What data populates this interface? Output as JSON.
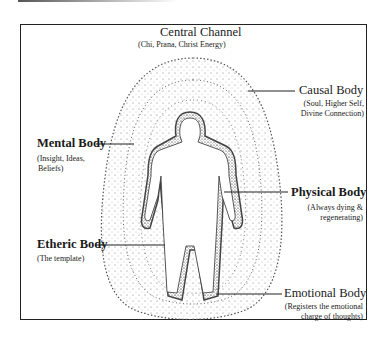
{
  "diagram": {
    "labels": {
      "central_channel": {
        "title": "Central Channel",
        "subtitle": "(Chi, Prana, Christ Energy)"
      },
      "causal_body": {
        "title": "Causal Body",
        "subtitle_line1": "(Soul, Higher Self,",
        "subtitle_line2": "Divine Connection)"
      },
      "mental_body": {
        "title": "Mental Body",
        "subtitle_line1": "(Insight, Ideas,",
        "subtitle_line2": "Beliefs)"
      },
      "physical_body": {
        "title": "Physical Body",
        "subtitle_line1": "(Always dying &",
        "subtitle_line2": "regenerating)"
      },
      "etheric_body": {
        "title": "Etheric Body",
        "subtitle": "(The template)"
      },
      "emotional_body": {
        "title": "Emotional Body",
        "subtitle_line1": "(Registers the emotional",
        "subtitle_line2": "charge of thoughts)"
      }
    },
    "colors": {
      "ink": "#1a1a1a",
      "frame": "#222222",
      "background": "#ffffff"
    }
  }
}
